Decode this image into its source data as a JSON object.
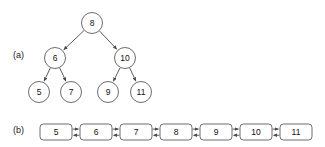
{
  "figure": {
    "background_color": "#ffffff",
    "stroke_color": "#4a4a4a",
    "node_fill_color": "#ffffff",
    "text_color": "#111111"
  },
  "panels": {
    "a": {
      "label": "(a)",
      "caption": "binary-search-tree"
    },
    "b": {
      "label": "(b)",
      "caption": "doubly-linked-list"
    }
  },
  "tree": {
    "type": "binary-search-tree",
    "root": "8",
    "nodes": [
      {
        "id": "n8",
        "value": "8",
        "cx": 92,
        "cy": 23,
        "r": 10.5,
        "level": 0
      },
      {
        "id": "n6",
        "value": "6",
        "cx": 55,
        "cy": 58,
        "r": 10.5,
        "level": 1
      },
      {
        "id": "n10",
        "value": "10",
        "cx": 125,
        "cy": 58,
        "r": 10.5,
        "level": 1
      },
      {
        "id": "n5",
        "value": "5",
        "cx": 39,
        "cy": 92,
        "r": 10.5,
        "level": 2
      },
      {
        "id": "n7",
        "value": "7",
        "cx": 71,
        "cy": 92,
        "r": 10.5,
        "level": 2
      },
      {
        "id": "n9",
        "value": "9",
        "cx": 108,
        "cy": 92,
        "r": 10.5,
        "level": 2
      },
      {
        "id": "n11",
        "value": "11",
        "cx": 141,
        "cy": 92,
        "r": 10.5,
        "level": 2
      }
    ],
    "edges": [
      {
        "from": "8",
        "to": "6",
        "direction": "down-left"
      },
      {
        "from": "8",
        "to": "10",
        "direction": "down-right"
      },
      {
        "from": "6",
        "to": "5",
        "direction": "down-left"
      },
      {
        "from": "6",
        "to": "7",
        "direction": "down-right"
      },
      {
        "from": "10",
        "to": "9",
        "direction": "down-left"
      },
      {
        "from": "10",
        "to": "11",
        "direction": "down-right"
      }
    ]
  },
  "list": {
    "type": "doubly-linked-list",
    "items": [
      {
        "value": "5",
        "x": 40,
        "y": 124
      },
      {
        "value": "6",
        "x": 80,
        "y": 124
      },
      {
        "value": "7",
        "x": 120,
        "y": 124
      },
      {
        "value": "8",
        "x": 160,
        "y": 124
      },
      {
        "value": "9",
        "x": 200,
        "y": 124
      },
      {
        "value": "10",
        "x": 240,
        "y": 124
      },
      {
        "value": "11",
        "x": 280,
        "y": 124
      }
    ],
    "box_width": 32,
    "box_height": 16,
    "connector_count": 6,
    "connector_style": "bidirectional-double-line"
  }
}
